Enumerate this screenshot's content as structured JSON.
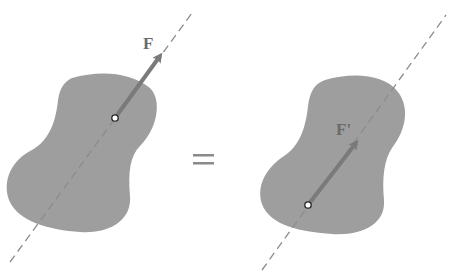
{
  "figure": {
    "left_panel": {
      "force_label": "F",
      "elements": [
        "rigid-body",
        "line-of-action",
        "force-vector",
        "point-of-application"
      ]
    },
    "equals_symbol": "=",
    "right_panel": {
      "force_label": "F'",
      "elements": [
        "rigid-body",
        "line-of-action",
        "force-vector",
        "point-of-application"
      ]
    }
  },
  "colors": {
    "body_fill": "#9e9e9e",
    "arrow": "#7a7a7a",
    "dashed_line": "#8c8c8c",
    "label": "#6a6a6a",
    "equals": "#8a8a8a"
  }
}
